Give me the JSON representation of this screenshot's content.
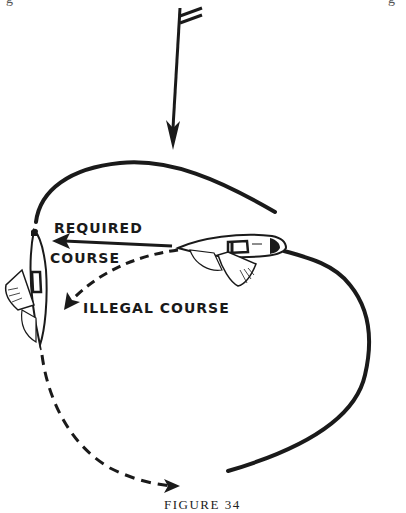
{
  "figure": {
    "caption": "FIGURE 34",
    "edge_fragments": {
      "left": "g",
      "right": "g"
    },
    "labels": {
      "required_line1": "REQUIRED",
      "required_line2": "COURSE",
      "illegal": "ILLEGAL COURSE"
    },
    "elements": {
      "wind_arrow": "wind-direction-arrow",
      "mark_rounding_path": "solid-course-line",
      "required_course_arrow": "solid-arrow-left",
      "illegal_course_arrow": "dashed-arrow",
      "boats": [
        "boat-overtaking-right",
        "boat-at-mark-left"
      ]
    },
    "colors": {
      "ink": "#1a1a1a",
      "background": "#ffffff"
    }
  }
}
